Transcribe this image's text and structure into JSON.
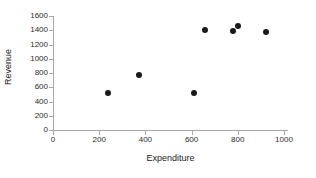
{
  "chart_data": {
    "type": "scatter",
    "title": "",
    "xlabel": "Expenditure",
    "ylabel": "Revenue",
    "xlim": [
      0,
      1000
    ],
    "ylim": [
      0,
      1600
    ],
    "grid": false,
    "legend": false,
    "marker": {
      "shape": "circle",
      "color": "#1a1a1a",
      "size": 6
    },
    "x_ticks": [
      0,
      200,
      400,
      600,
      800,
      1000
    ],
    "y_ticks": [
      0,
      200,
      400,
      600,
      800,
      1000,
      1200,
      1400,
      1600
    ],
    "x_tick_labels": [
      "0",
      "200",
      "400",
      "600",
      "800",
      "1000"
    ],
    "y_tick_labels": [
      "0",
      "200",
      "400",
      "600",
      "800",
      "1000",
      "1200",
      "1400",
      "1600"
    ],
    "points": [
      {
        "x": 239,
        "y": 520
      },
      {
        "x": 373,
        "y": 772
      },
      {
        "x": 612,
        "y": 520
      },
      {
        "x": 660,
        "y": 1404
      },
      {
        "x": 781,
        "y": 1389
      },
      {
        "x": 803,
        "y": 1460
      },
      {
        "x": 920,
        "y": 1375
      }
    ],
    "series": [
      {
        "name": "Revenue vs Expenditure",
        "x": [
          239,
          373,
          612,
          660,
          781,
          803,
          920
        ],
        "values": [
          520,
          772,
          520,
          1404,
          1389,
          1460,
          1375
        ]
      }
    ]
  },
  "axes": {
    "x_title": "Expenditure",
    "y_title": "Revenue"
  },
  "colors": {
    "marker": "#1a1a1a",
    "axis": "#a8a8a8",
    "text": "#1c1c1c",
    "background": "#ffffff"
  }
}
